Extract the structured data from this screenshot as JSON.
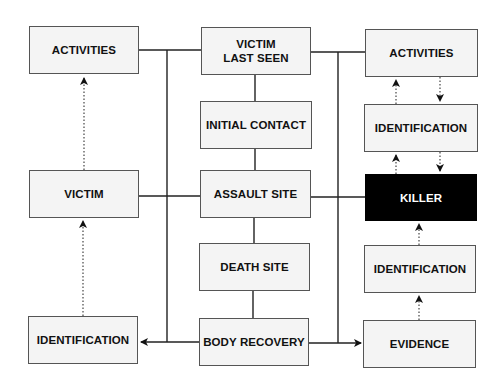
{
  "diagram": {
    "type": "flowchart",
    "left_column": {
      "activities": "ACTIVITIES",
      "victim": "VICTIM",
      "identification": "IDENTIFICATION"
    },
    "center_column": {
      "victim_last_seen": "VICTIM\nLAST SEEN",
      "initial_contact": "INITIAL CONTACT",
      "assault_site": "ASSAULT SITE",
      "death_site": "DEATH SITE",
      "body_recovery": "BODY RECOVERY"
    },
    "right_column": {
      "activities": "ACTIVITIES",
      "identification_upper": "IDENTIFICATION",
      "killer": "KILLER",
      "identification_lower": "IDENTIFICATION",
      "evidence": "EVIDENCE"
    },
    "colors": {
      "box_fill": "#f4f4f4",
      "box_border": "#555555",
      "highlight_fill": "#000000",
      "highlight_text": "#ffffff",
      "line": "#222222"
    },
    "edges": [
      {
        "from": "victim_last_seen",
        "to": "initial_contact",
        "style": "solid"
      },
      {
        "from": "initial_contact",
        "to": "assault_site",
        "style": "solid"
      },
      {
        "from": "assault_site",
        "to": "death_site",
        "style": "solid"
      },
      {
        "from": "death_site",
        "to": "body_recovery",
        "style": "solid"
      },
      {
        "from": "center_column",
        "to": "left_column",
        "style": "solid bus"
      },
      {
        "from": "center_column",
        "to": "right_column",
        "style": "solid bus"
      },
      {
        "from": "body_recovery",
        "to": "left.identification",
        "style": "solid arrow"
      },
      {
        "from": "body_recovery",
        "to": "right.evidence",
        "style": "solid arrow"
      },
      {
        "from": "left.victim",
        "to": "left.activities",
        "style": "dotted arrow"
      },
      {
        "from": "left.identification",
        "to": "left.victim",
        "style": "dotted arrow"
      },
      {
        "from": "right.identification_upper",
        "to": "right.activities",
        "style": "dotted arrow"
      },
      {
        "from": "right.activities",
        "to": "right.identification_upper",
        "style": "dotted arrow"
      },
      {
        "from": "right.killer",
        "to": "right.identification_upper",
        "style": "dotted arrow"
      },
      {
        "from": "right.identification_upper",
        "to": "right.killer",
        "style": "dotted arrow"
      },
      {
        "from": "right.identification_lower",
        "to": "right.killer",
        "style": "dotted arrow"
      },
      {
        "from": "right.evidence",
        "to": "right.identification_lower",
        "style": "dotted arrow"
      }
    ]
  }
}
